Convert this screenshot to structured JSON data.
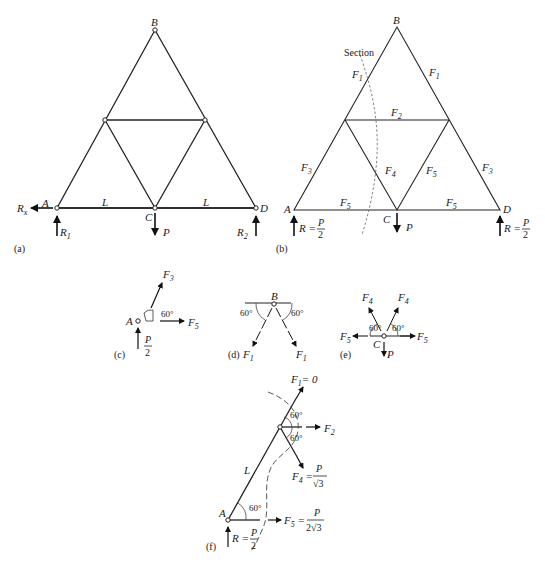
{
  "figure": {
    "panels": {
      "a": {
        "label": "(a)",
        "nodes": {
          "A": "A",
          "B": "B",
          "C": "C",
          "D": "D"
        },
        "span_left": "L",
        "span_right": "L",
        "reactions": {
          "Rx": "R",
          "Rx_sub": "x",
          "R1": "R",
          "R1_sub": "1",
          "R2": "R",
          "R2_sub": "2"
        },
        "load": "P"
      },
      "b": {
        "label": "(b)",
        "section_label": "Section",
        "nodes": {
          "A": "A",
          "B": "B",
          "C": "C",
          "D": "D"
        },
        "members": {
          "F1": "F",
          "F1_sub": "1",
          "F2": "F",
          "F2_sub": "2",
          "F3": "F",
          "F3_sub": "3",
          "F4": "F",
          "F4_sub": "4",
          "F5": "F",
          "F5_sub": "5"
        },
        "reaction": {
          "R": "R =",
          "num": "P",
          "den": "2"
        },
        "load": "P"
      },
      "c": {
        "label": "(c)",
        "node": "A",
        "angle": "60°",
        "force_up": "F",
        "force_up_sub": "3",
        "force_right": "F",
        "force_right_sub": "5",
        "reaction_num": "P",
        "reaction_den": "2"
      },
      "d": {
        "label": "(d)",
        "node": "B",
        "angle_left": "60°",
        "angle_right": "60°",
        "force": "F",
        "force_sub": "1"
      },
      "e": {
        "label": "(e)",
        "node": "C",
        "angle_left": "60°",
        "angle_right": "60°",
        "force_diag": "F",
        "force_diag_sub": "4",
        "force_horiz": "F",
        "force_horiz_sub": "5",
        "load": "P"
      },
      "f": {
        "label": "(f)",
        "node": "A",
        "span": "L",
        "angle_top": "60°",
        "angle_mid": "60°",
        "angle_base": "60°",
        "F1_eq": "F",
        "F1_sub": "1",
        "F1_val": "= 0",
        "F2": "F",
        "F2_sub": "2",
        "F4": "F",
        "F4_sub": "4",
        "F4_num": "P",
        "F4_den": "√3",
        "F5": "F",
        "F5_sub": "5",
        "F5_num": "P",
        "F5_den": "2√3",
        "reaction": {
          "R": "R =",
          "num": "P",
          "den": "2"
        }
      }
    }
  }
}
